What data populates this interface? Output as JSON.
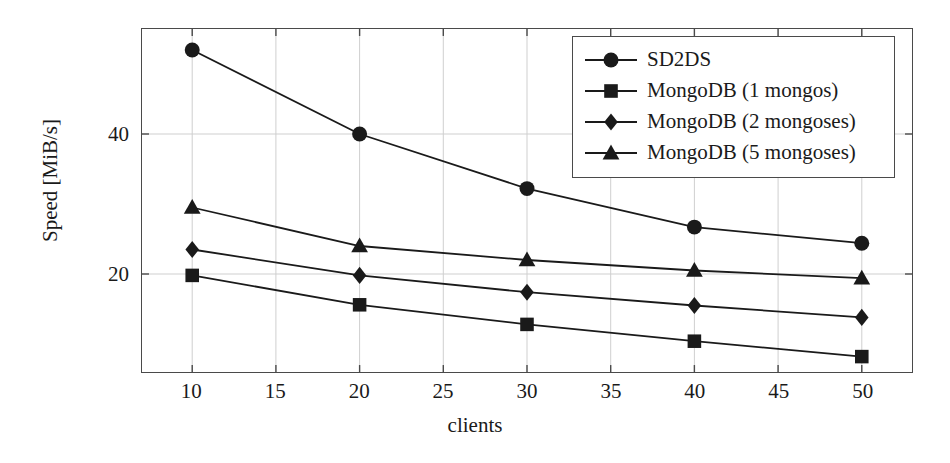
{
  "chart_data": {
    "type": "line",
    "title": "",
    "xlabel": "clients",
    "ylabel": "Speed [MiB/s]",
    "xlim": [
      7,
      53
    ],
    "ylim": [
      6,
      55
    ],
    "x": [
      10,
      20,
      30,
      40,
      50
    ],
    "xticks": [
      10,
      15,
      20,
      25,
      30,
      35,
      40,
      45,
      50
    ],
    "yticks": [
      20,
      40
    ],
    "grid": true,
    "legend_position": "top-right",
    "series": [
      {
        "name": "SD2DS",
        "marker": "circle",
        "color": "#1a1a1a",
        "values": [
          52.0,
          40.0,
          32.2,
          26.7,
          24.4
        ]
      },
      {
        "name": "MongoDB (1 mongos)",
        "marker": "square",
        "color": "#1a1a1a",
        "values": [
          19.8,
          15.6,
          12.8,
          10.4,
          8.2
        ]
      },
      {
        "name": "MongoDB (2 mongoses)",
        "marker": "diamond",
        "color": "#1a1a1a",
        "values": [
          23.5,
          19.8,
          17.4,
          15.5,
          13.8
        ]
      },
      {
        "name": "MongoDB (5 mongoses)",
        "marker": "triangle",
        "color": "#1a1a1a",
        "values": [
          29.5,
          24.0,
          22.0,
          20.5,
          19.4
        ]
      }
    ]
  },
  "axis": {
    "x_tick_labels": [
      "10",
      "15",
      "20",
      "25",
      "30",
      "35",
      "40",
      "45",
      "50"
    ],
    "y_tick_labels": [
      "20",
      "40"
    ],
    "x_title": "clients",
    "y_title": "Speed [MiB/s]"
  },
  "legend": {
    "entries": [
      {
        "label": "SD2DS",
        "marker": "circle"
      },
      {
        "label": "MongoDB (1 mongos)",
        "marker": "square"
      },
      {
        "label": "MongoDB (2 mongoses)",
        "marker": "diamond"
      },
      {
        "label": "MongoDB (5 mongoses)",
        "marker": "triangle"
      }
    ]
  },
  "style": {
    "frame_color": "#4a4a4a",
    "grid_color": "#cfcfcf",
    "series_color": "#1a1a1a",
    "background": "#ffffff"
  }
}
